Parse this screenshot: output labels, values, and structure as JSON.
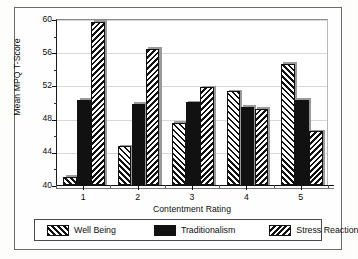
{
  "chart_data": {
    "type": "bar",
    "title": "",
    "xlabel": "Contentment Rating",
    "ylabel": "Mean MPQ T-Score",
    "categories": [
      "1",
      "2",
      "3",
      "4",
      "5"
    ],
    "series": [
      {
        "name": "Well Being",
        "values": [
          41.0,
          44.7,
          47.5,
          51.3,
          54.6
        ],
        "fill": "forward-hatch"
      },
      {
        "name": "Traditionalism",
        "values": [
          50.3,
          49.8,
          50.0,
          49.4,
          50.3
        ],
        "fill": "solid-black"
      },
      {
        "name": "Stress Reaction",
        "values": [
          59.7,
          56.4,
          51.8,
          49.2,
          46.5
        ],
        "fill": "backward-hatch"
      }
    ],
    "ylim": [
      40,
      60
    ],
    "y_major_ticks": [
      40,
      44,
      48,
      52,
      56,
      60
    ],
    "y_minor_ticks": [
      42,
      46,
      50,
      54,
      58
    ],
    "y_tick_labels": [
      "40",
      "44",
      "48",
      "52",
      "56",
      "60"
    ],
    "grid": true,
    "grid_axis": "y",
    "legend_position": "bottom",
    "legend_entries": [
      "Well Being",
      "Traditionalism",
      "Stress Reaction"
    ]
  },
  "axes": {
    "y_title": "Mean MPQ T-Score",
    "x_title": "Contentment Rating"
  },
  "legend": {
    "items": [
      {
        "label": "Well Being"
      },
      {
        "label": "Traditionalism"
      },
      {
        "label": "Stress Reaction"
      }
    ]
  },
  "colors": {
    "bar_outline": "#111111",
    "solid_fill": "#111111",
    "hatch": "#111111",
    "background": "#ffffff",
    "gridline": "#d8d8d8",
    "frame": "#6a6a6a"
  }
}
